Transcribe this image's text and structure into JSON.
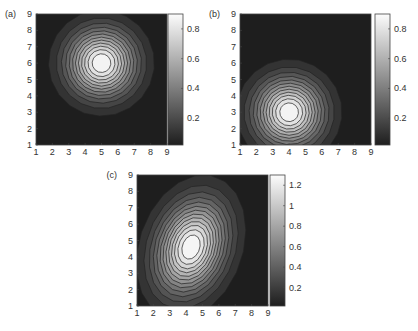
{
  "chart_data": [
    {
      "id": "a",
      "panel_label": "(a)",
      "type": "heatmap",
      "subtype": "filled-contour",
      "title": "",
      "xlabel": "",
      "ylabel": "",
      "x_ticks": [
        "1",
        "2",
        "3",
        "4",
        "5",
        "6",
        "7",
        "8",
        "9"
      ],
      "y_ticks": [
        "1",
        "2",
        "3",
        "4",
        "5",
        "6",
        "7",
        "8",
        "9"
      ],
      "xlim": [
        1,
        9
      ],
      "ylim": [
        1,
        9
      ],
      "peak": {
        "x": 5,
        "y": 6,
        "value": 0.9
      },
      "spread": {
        "sx": 2.6,
        "sy": 2.6,
        "rotation_deg": 0
      },
      "colorbar": {
        "ticks": [
          "0.2",
          "0.4",
          "0.6",
          "0.8"
        ],
        "tick_values": [
          0.2,
          0.4,
          0.6,
          0.8
        ],
        "range": [
          0.02,
          0.9
        ]
      },
      "colormap": "gray",
      "contour_levels": 12,
      "box": {
        "left": 36,
        "top": 14,
        "size": 131
      },
      "cbar_box": {
        "left": 168,
        "top": 14,
        "width": 15,
        "height": 131
      }
    },
    {
      "id": "b",
      "panel_label": "(b)",
      "type": "heatmap",
      "subtype": "filled-contour",
      "title": "",
      "xlabel": "",
      "ylabel": "",
      "x_ticks": [
        "1",
        "2",
        "3",
        "4",
        "5",
        "6",
        "7",
        "8",
        "9"
      ],
      "y_ticks": [
        "1",
        "2",
        "3",
        "4",
        "5",
        "6",
        "7",
        "8",
        "9"
      ],
      "xlim": [
        1,
        9
      ],
      "ylim": [
        1,
        9
      ],
      "peak": {
        "x": 4,
        "y": 3,
        "value": 0.9
      },
      "spread": {
        "sx": 2.6,
        "sy": 2.6,
        "rotation_deg": 0
      },
      "colorbar": {
        "ticks": [
          "0.2",
          "0.4",
          "0.6",
          "0.8"
        ],
        "tick_values": [
          0.2,
          0.4,
          0.6,
          0.8
        ],
        "range": [
          0.02,
          0.9
        ]
      },
      "colormap": "gray",
      "contour_levels": 12,
      "box": {
        "left": 240,
        "top": 14,
        "size": 131
      },
      "cbar_box": {
        "left": 375,
        "top": 14,
        "width": 15,
        "height": 131
      }
    },
    {
      "id": "c",
      "panel_label": "(c)",
      "type": "heatmap",
      "subtype": "filled-contour",
      "title": "",
      "xlabel": "",
      "ylabel": "",
      "x_ticks": [
        "1",
        "2",
        "3",
        "4",
        "5",
        "6",
        "7",
        "8",
        "9"
      ],
      "y_ticks": [
        "1",
        "2",
        "3",
        "4",
        "5",
        "6",
        "7",
        "8",
        "9"
      ],
      "xlim": [
        1,
        9
      ],
      "ylim": [
        1,
        9
      ],
      "peak": {
        "x": 4.3,
        "y": 4.6,
        "value": 1.3
      },
      "spread": {
        "sx": 2.5,
        "sy": 3.6,
        "rotation_deg": -20
      },
      "colorbar": {
        "ticks": [
          "0.2",
          "0.4",
          "0.6",
          "0.8",
          "1",
          "1.2"
        ],
        "tick_values": [
          0.2,
          0.4,
          0.6,
          0.8,
          1,
          1.2
        ],
        "range": [
          0.02,
          1.3
        ]
      },
      "colormap": "gray",
      "contour_levels": 13,
      "box": {
        "left": 137,
        "top": 175,
        "size": 131
      },
      "cbar_box": {
        "left": 270,
        "top": 175,
        "width": 15,
        "height": 131
      }
    }
  ]
}
